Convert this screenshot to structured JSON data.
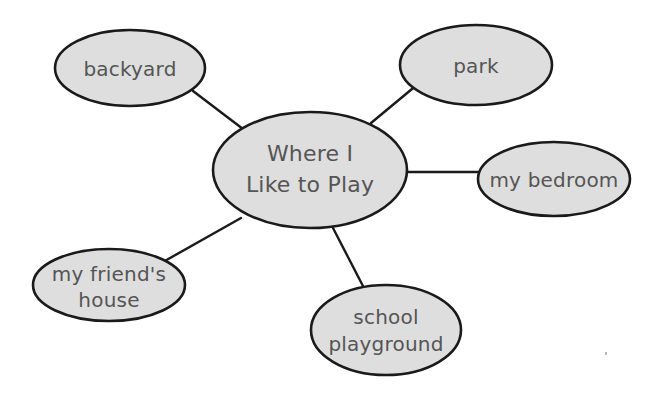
{
  "diagram": {
    "type": "mind-map",
    "title": "Where I Like to Play",
    "background_color": "#ffffff",
    "node_fill_color": "#dedede",
    "node_stroke_color": "#1a1a1a",
    "text_color": "#555555"
  },
  "center": {
    "label": "Where I Like to Play",
    "line1": "Where I",
    "line2": "Like to Play"
  },
  "branches": [
    {
      "id": "backyard",
      "label": "backyard",
      "line1": "backyard",
      "line2": ""
    },
    {
      "id": "park",
      "label": "park",
      "line1": "park",
      "line2": ""
    },
    {
      "id": "my-bedroom",
      "label": "my bedroom",
      "line1": "my bedroom",
      "line2": ""
    },
    {
      "id": "school-playground",
      "label": "school playground",
      "line1": "school",
      "line2": "playground"
    },
    {
      "id": "my-friends-house",
      "label": "my friend's house",
      "line1": "my friend's",
      "line2": "house"
    }
  ]
}
